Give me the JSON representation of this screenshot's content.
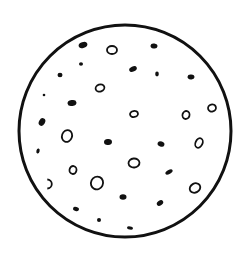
{
  "image": {
    "description": "Hand-drawn circle with scattered dots and small rings",
    "background": "#ffffff",
    "ink": "#111111",
    "circle": {
      "cx": 125,
      "cy": 131,
      "r": 106,
      "stroke_width": 3
    },
    "filled_dots": [
      {
        "x": 83,
        "y": 45,
        "rx": 4.5,
        "ry": 3,
        "rot": -20
      },
      {
        "x": 154,
        "y": 46,
        "rx": 3.5,
        "ry": 2.5,
        "rot": 10
      },
      {
        "x": 81,
        "y": 64,
        "rx": 2,
        "ry": 1.8,
        "rot": 0
      },
      {
        "x": 133,
        "y": 69,
        "rx": 4,
        "ry": 2.6,
        "rot": -25
      },
      {
        "x": 157,
        "y": 74,
        "rx": 1.8,
        "ry": 2.4,
        "rot": 0
      },
      {
        "x": 60,
        "y": 75,
        "rx": 2.5,
        "ry": 2.2,
        "rot": 0
      },
      {
        "x": 191,
        "y": 77,
        "rx": 3.5,
        "ry": 2.4,
        "rot": 5
      },
      {
        "x": 44,
        "y": 95,
        "rx": 1.3,
        "ry": 1.3,
        "rot": 0
      },
      {
        "x": 72,
        "y": 103,
        "rx": 4.5,
        "ry": 3,
        "rot": -10
      },
      {
        "x": 42,
        "y": 122,
        "rx": 3,
        "ry": 4,
        "rot": 30
      },
      {
        "x": 38,
        "y": 151,
        "rx": 1.6,
        "ry": 2.6,
        "rot": 15
      },
      {
        "x": 108,
        "y": 142,
        "rx": 4,
        "ry": 3,
        "rot": -5
      },
      {
        "x": 161,
        "y": 144,
        "rx": 3.5,
        "ry": 2.6,
        "rot": 20
      },
      {
        "x": 169,
        "y": 172,
        "rx": 4,
        "ry": 2,
        "rot": -30
      },
      {
        "x": 123,
        "y": 197,
        "rx": 3.5,
        "ry": 2.8,
        "rot": 0
      },
      {
        "x": 160,
        "y": 203,
        "rx": 3.5,
        "ry": 2.4,
        "rot": -35
      },
      {
        "x": 76,
        "y": 209,
        "rx": 3,
        "ry": 2,
        "rot": 15
      },
      {
        "x": 99,
        "y": 220,
        "rx": 2,
        "ry": 2,
        "rot": 0
      },
      {
        "x": 130,
        "y": 228,
        "rx": 3,
        "ry": 1.6,
        "rot": 10
      }
    ],
    "ring_spots": [
      {
        "x": 112,
        "y": 50,
        "rx": 5,
        "ry": 4,
        "rot": 0
      },
      {
        "x": 100,
        "y": 88,
        "rx": 4.5,
        "ry": 3.5,
        "rot": -20
      },
      {
        "x": 134,
        "y": 114,
        "rx": 4,
        "ry": 3,
        "rot": -10
      },
      {
        "x": 186,
        "y": 115,
        "rx": 3.5,
        "ry": 4,
        "rot": 15
      },
      {
        "x": 212,
        "y": 108,
        "rx": 4,
        "ry": 3.5,
        "rot": -15
      },
      {
        "x": 67,
        "y": 136,
        "rx": 5,
        "ry": 6,
        "rot": 20
      },
      {
        "x": 199,
        "y": 143,
        "rx": 3.5,
        "ry": 5,
        "rot": 25
      },
      {
        "x": 134,
        "y": 163,
        "rx": 5.5,
        "ry": 4.5,
        "rot": -5
      },
      {
        "x": 73,
        "y": 170,
        "rx": 3.5,
        "ry": 4,
        "rot": 10
      },
      {
        "x": 97,
        "y": 183,
        "rx": 6,
        "ry": 6.5,
        "rot": 25
      },
      {
        "x": 195,
        "y": 188,
        "rx": 5.5,
        "ry": 4.5,
        "rot": -30
      }
    ],
    "open_marks": [
      {
        "x": 50,
        "y": 184,
        "r": 4.5
      }
    ]
  }
}
